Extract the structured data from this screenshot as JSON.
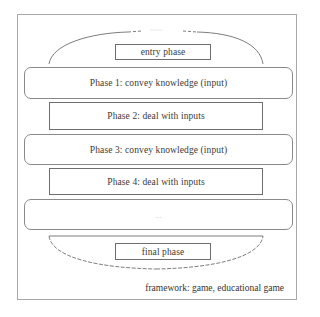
{
  "diagram": {
    "entry": {
      "label": "entry phase"
    },
    "phases": [
      {
        "label": "Phase 1: convey knowledge (input)",
        "style": "rounded"
      },
      {
        "label": "Phase 2: deal with inputs",
        "style": "square"
      },
      {
        "label": "Phase 3: convey knowledge (input)",
        "style": "rounded"
      },
      {
        "label": "Phase 4: deal with inputs",
        "style": "square"
      },
      {
        "label": "...",
        "style": "rounded"
      }
    ],
    "final": {
      "label": "final phase"
    },
    "caption": "framework: game, educational game"
  },
  "colors": {
    "border_outer": "#a8a8a8",
    "border_box": "#6e6e6e",
    "text": "#333333",
    "background": "#ffffff"
  }
}
